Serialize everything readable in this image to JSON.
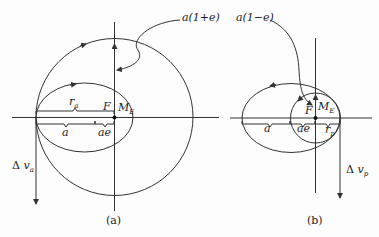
{
  "figure_a": {
    "caption": "(a)",
    "label_a1pe": "a(1+e)",
    "label_ra_main": "r",
    "label_ra_sub": "a",
    "label_F": "F",
    "label_ME_main": "M",
    "label_ME_sub": "E",
    "label_a": "a",
    "label_ae": "ae",
    "label_dv_delta": "Δ",
    "label_dv_main": "v",
    "label_dv_sub": "a"
  },
  "figure_b": {
    "caption": "(b)",
    "label_a1me": "a(1−e)",
    "label_F": "F",
    "label_ME_main": "M",
    "label_ME_sub": "E",
    "label_a": "a",
    "label_ae": "ae",
    "label_rp_main": "r",
    "label_rp_sub": "p",
    "label_dv_delta": "Δ",
    "label_dv_main": "v",
    "label_dv_sub": "p"
  },
  "colors": {
    "line": "#333333",
    "background": "#fdfdfd"
  }
}
